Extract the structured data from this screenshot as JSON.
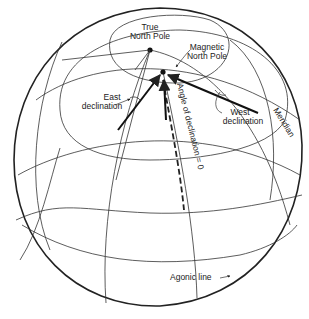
{
  "diagram": {
    "labels": {
      "true_north_line1": "True",
      "true_north_line2": "North Pole",
      "magnetic_north_line1": "Magnetic",
      "magnetic_north_line2": "North Pole",
      "east_decl_line1": "East",
      "east_decl_line2": "declination",
      "west_decl_line1": "West",
      "west_decl_line2": "declination",
      "meridian": "Meridian",
      "angle_zero": "Angle of declination = 0",
      "agonic": "Agonic line"
    },
    "colors": {
      "ink": "#222222",
      "background": "#ffffff"
    }
  }
}
